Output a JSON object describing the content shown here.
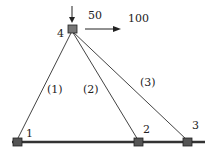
{
  "diagram": {
    "type": "truss",
    "nodes": [
      {
        "id": "1",
        "label": "1",
        "x": 17,
        "y": 142
      },
      {
        "id": "2",
        "label": "2",
        "x": 138,
        "y": 142
      },
      {
        "id": "3",
        "label": "3",
        "x": 187,
        "y": 142
      },
      {
        "id": "4",
        "label": "4",
        "x": 72,
        "y": 29
      }
    ],
    "members": [
      {
        "label": "(1)",
        "from": "4",
        "to": "1"
      },
      {
        "label": "(2)",
        "from": "4",
        "to": "2"
      },
      {
        "label": "(3)",
        "from": "4",
        "to": "3"
      }
    ],
    "loads": [
      {
        "label": "50",
        "direction": "down",
        "node": "4"
      },
      {
        "label": "100",
        "direction": "right",
        "node": "4"
      }
    ],
    "colors": {
      "line": "#333333",
      "node": "#666666",
      "ground": "#333333"
    }
  }
}
